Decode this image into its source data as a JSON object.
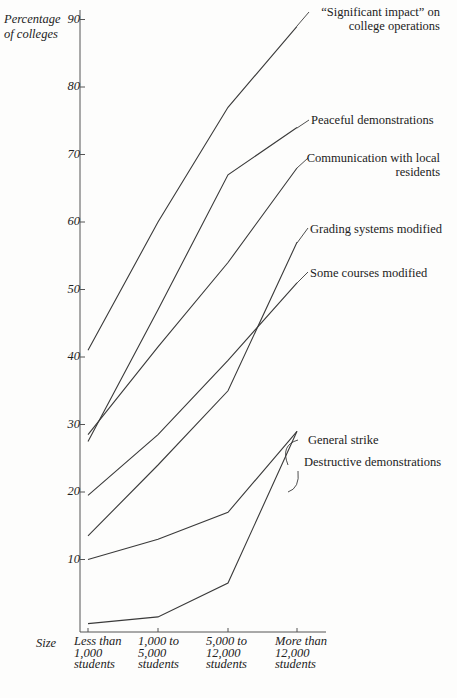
{
  "chart_data": {
    "type": "line",
    "title": "",
    "title_fragment_visible": "(cut off at top)",
    "ylabel": "Percentage of colleges",
    "xlabel": "Size",
    "ylim": [
      0,
      90
    ],
    "yticks": [
      10,
      20,
      30,
      40,
      50,
      60,
      70,
      80,
      90
    ],
    "grid": false,
    "legend_position": "inline-right",
    "categories": [
      "Less than 1,000 students",
      "1,000 to 5,000 students",
      "5,000 to 12,000 students",
      "More than 12,000 students"
    ],
    "series": [
      {
        "name": "“Significant impact” on college operations",
        "values": [
          41,
          60,
          77,
          89
        ]
      },
      {
        "name": "Peaceful demonstrations",
        "values": [
          27.5,
          47,
          67,
          74
        ]
      },
      {
        "name": "Communication with local residents",
        "values": [
          28.5,
          41.5,
          54,
          68
        ]
      },
      {
        "name": "Grading systems modified",
        "values": [
          13.5,
          24,
          35,
          57
        ]
      },
      {
        "name": "Some courses modified",
        "values": [
          19.5,
          28.5,
          39.5,
          51
        ]
      },
      {
        "name": "General strike",
        "values": [
          10,
          13,
          17,
          29
        ]
      },
      {
        "name": "Destructive demonstrations",
        "values": [
          0.5,
          1.5,
          6.5,
          29
        ]
      }
    ]
  },
  "labels": {
    "ylabel_line1": "Percentage",
    "ylabel_line2": "of colleges",
    "xlabel": "Size",
    "yticks": [
      "90",
      "80",
      "70",
      "60",
      "50",
      "40",
      "30",
      "20",
      "10"
    ],
    "xcats": [
      [
        "Less than",
        "1,000",
        "students"
      ],
      [
        "1,000 to",
        "5,000",
        "students"
      ],
      [
        "5,000 to",
        "12,000",
        "students"
      ],
      [
        "More than",
        "12,000",
        "students"
      ]
    ],
    "series": {
      "sig_1": "“Significant impact” on",
      "sig_2": "college operations",
      "peaceful": "Peaceful demonstrations",
      "comm_1": "Communication with local",
      "comm_2": "residents",
      "grading": "Grading systems modified",
      "courses": "Some courses modified",
      "strike": "General strike",
      "destructive": "Destructive demonstrations"
    }
  },
  "colors": {
    "line": "#3a3a3a",
    "axis": "#555555",
    "background": "#fdfdfc"
  }
}
